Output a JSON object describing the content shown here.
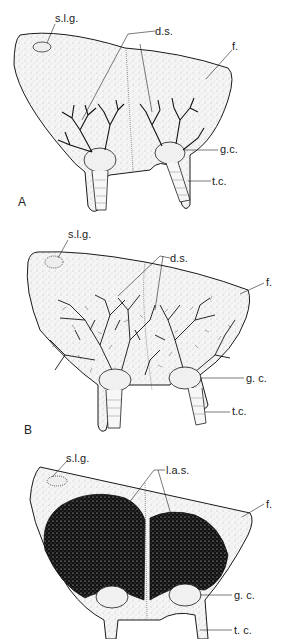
{
  "figure": {
    "panels": [
      {
        "id": "A",
        "letter": "A",
        "labels": {
          "slg": "s.l.g.",
          "ds": "d.s.",
          "f": "f.",
          "gc": "g.c.",
          "tc": "t.c."
        }
      },
      {
        "id": "B",
        "letter": "B",
        "labels": {
          "slg": "s.l.g.",
          "ds": "d.s.",
          "f": "f.",
          "gc": "g. c.",
          "tc": "t.c."
        }
      },
      {
        "id": "C",
        "letter": "",
        "labels": {
          "slg": "s.l.g.",
          "las": "l.a.s.",
          "f": "f.",
          "gc": "g. c.",
          "tc": "t. c."
        }
      }
    ],
    "colors": {
      "ink": "#1a1a1a",
      "stipple": "#bdbdbd",
      "fill": "#f4f4f4",
      "background": "#ffffff"
    }
  }
}
